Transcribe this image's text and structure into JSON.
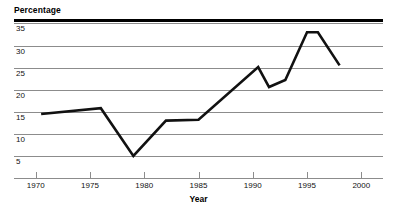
{
  "chart_data": {
    "type": "line",
    "title": "",
    "xlabel": "Year",
    "ylabel": "Percentage",
    "xlim": [
      1968,
      2002
    ],
    "ylim": [
      0,
      36
    ],
    "grid": true,
    "legend": "none",
    "x_ticks": [
      1970,
      1975,
      1980,
      1985,
      1990,
      1995,
      2000
    ],
    "y_ticks": [
      5,
      10,
      15,
      20,
      25,
      30,
      35
    ],
    "series": [
      {
        "name": "Percentage",
        "color": "#111111",
        "x": [
          1970.5,
          1976.0,
          1979.0,
          1982.0,
          1985.0,
          1990.5,
          1991.5,
          1993.0,
          1995.0,
          1996.0,
          1998.0
        ],
        "values": [
          14.5,
          15.8,
          5.0,
          13.0,
          13.2,
          25.1,
          20.6,
          22.2,
          33.0,
          33.0,
          25.5
        ]
      }
    ]
  },
  "axes": {
    "y_title": "Percentage",
    "x_title": "Year",
    "y_tick_labels": [
      "35",
      "30",
      "25",
      "20",
      "15",
      "10",
      "5"
    ],
    "x_tick_labels": [
      "1970",
      "1975",
      "1980",
      "1985",
      "1990",
      "1995",
      "2000"
    ]
  },
  "style": {
    "line_color": "#111111",
    "grid_color": "#8c8c8c",
    "rule_color": "#000000",
    "background": "#ffffff"
  }
}
